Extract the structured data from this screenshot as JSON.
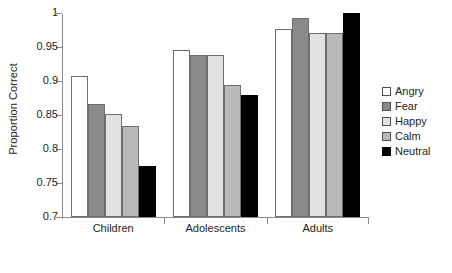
{
  "chart_data": {
    "type": "bar",
    "title": "",
    "xlabel": "",
    "ylabel": "Proportion Correct",
    "ylim": [
      0.7,
      1.0
    ],
    "yticks": [
      "1",
      "0.95",
      "0.9",
      "0.85",
      "0.8",
      "0.75",
      "0.7"
    ],
    "ytick_values": [
      1.0,
      0.95,
      0.9,
      0.85,
      0.8,
      0.75,
      0.7
    ],
    "grid": false,
    "legend_position": "right",
    "categories": [
      "Children",
      "Adolescents",
      "Adults"
    ],
    "series": [
      {
        "name": "Angry",
        "color": "#ffffff",
        "values": [
          0.908,
          0.945,
          0.977
        ]
      },
      {
        "name": "Fear",
        "color": "#8a8a8a",
        "values": [
          0.866,
          0.938,
          0.993
        ]
      },
      {
        "name": "Happy",
        "color": "#e2e2e2",
        "values": [
          0.851,
          0.938,
          0.97
        ]
      },
      {
        "name": "Calm",
        "color": "#b9b9b9",
        "values": [
          0.834,
          0.894,
          0.97
        ]
      },
      {
        "name": "Neutral",
        "color": "#000000",
        "values": [
          0.775,
          0.879,
          1.0
        ]
      }
    ]
  },
  "legend": {
    "items": [
      {
        "label": "Angry",
        "color": "#ffffff"
      },
      {
        "label": "Fear",
        "color": "#8a8a8a"
      },
      {
        "label": "Happy",
        "color": "#e2e2e2"
      },
      {
        "label": "Calm",
        "color": "#b9b9b9"
      },
      {
        "label": "Neutral",
        "color": "#000000"
      }
    ]
  }
}
